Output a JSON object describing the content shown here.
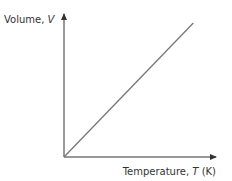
{
  "chart_data": {
    "type": "line",
    "title": "",
    "xlabel_text": "Temperature, ",
    "xlabel_var": "T",
    "xlabel_unit": " (K)",
    "ylabel_text": "Volume, ",
    "ylabel_var": "V",
    "x": [
      0,
      1
    ],
    "series": [
      {
        "name": "V vs T",
        "values": [
          0,
          1
        ]
      }
    ],
    "xlim": [
      0,
      1.16
    ],
    "ylim": [
      0,
      1.0
    ],
    "grid": false,
    "ticks": false,
    "colors": {
      "axis": "#333333",
      "line": "#777777"
    }
  }
}
